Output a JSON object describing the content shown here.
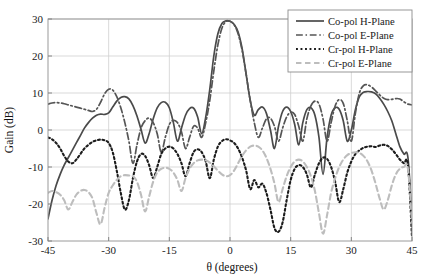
{
  "chart_data": {
    "type": "line",
    "title": "",
    "xlabel": "θ (degrees)",
    "ylabel": "Gain (dB)",
    "xlim": [
      -45,
      45
    ],
    "ylim": [
      -30,
      30
    ],
    "xticks": [
      -45,
      -30,
      -15,
      0,
      15,
      30,
      45
    ],
    "xticklabels": [
      "-45",
      "-30",
      "-15",
      "0",
      "15",
      "30",
      "45"
    ],
    "yticks": [
      -30,
      -20,
      -10,
      0,
      10,
      20,
      30
    ],
    "yticklabels": [
      "-30",
      "-20",
      "-10",
      "0",
      "10",
      "20",
      "30"
    ],
    "grid": true,
    "legend_position": "upper right",
    "series": [
      {
        "name": "Co-pol H-Plane",
        "color": "#4a4a4a",
        "style": "solid",
        "width": 1.7,
        "x": [
          -45,
          -44,
          -43,
          -42,
          -41,
          -40,
          -39,
          -38,
          -37,
          -36,
          -35,
          -34,
          -33,
          -32,
          -31,
          -30,
          -29,
          -28,
          -27,
          -26,
          -25,
          -24,
          -23,
          -22,
          -21,
          -20,
          -19,
          -18,
          -17,
          -16,
          -15,
          -14,
          -13,
          -12,
          -11,
          -10,
          -9,
          -8,
          -7,
          -6,
          -5,
          -4,
          -3,
          -2,
          -1,
          0,
          1,
          2,
          3,
          4,
          5,
          6,
          7,
          8,
          9,
          10,
          11,
          12,
          13,
          14,
          15,
          16,
          17,
          18,
          19,
          20,
          21,
          22,
          23,
          24,
          25,
          26,
          27,
          28,
          29,
          30,
          31,
          32,
          33,
          34,
          35,
          36,
          37,
          38,
          39,
          40,
          41,
          42,
          43,
          44,
          45
        ],
        "y": [
          -24.0,
          -19.0,
          -15.0,
          -12.0,
          -9.5,
          -7.5,
          -5.5,
          -3.5,
          -1.5,
          0.5,
          2.0,
          3.2,
          4.0,
          4.3,
          4.2,
          4.6,
          6.2,
          7.8,
          8.8,
          9.0,
          8.4,
          6.6,
          3.8,
          0.2,
          -3.5,
          -1.0,
          3.0,
          6.0,
          7.4,
          7.5,
          6.0,
          2.0,
          -3.0,
          0.5,
          4.0,
          5.8,
          5.9,
          3.5,
          -1.0,
          3.5,
          11.0,
          20.0,
          26.0,
          28.8,
          29.5,
          29.4,
          28.6,
          26.5,
          22.0,
          15.0,
          8.0,
          4.0,
          5.5,
          6.2,
          4.5,
          0.0,
          -5.0,
          1.0,
          5.0,
          6.2,
          5.0,
          1.5,
          -4.0,
          2.0,
          5.5,
          6.0,
          4.0,
          -2.0,
          -12.0,
          -2.0,
          4.0,
          6.0,
          5.6,
          2.5,
          -3.0,
          0.0,
          5.5,
          9.0,
          10.2,
          10.4,
          10.3,
          9.8,
          8.6,
          7.0,
          5.0,
          2.5,
          -1.0,
          -4.5,
          -6.5,
          -7.5,
          -24.0
        ]
      },
      {
        "name": "Co-pol E-Plane",
        "color": "#555555",
        "style": "dashdot",
        "width": 1.7,
        "x": [
          -45,
          -44,
          -43,
          -42,
          -41,
          -40,
          -39,
          -38,
          -37,
          -36,
          -35,
          -34,
          -33,
          -32,
          -31,
          -30,
          -29,
          -28,
          -27,
          -26,
          -25,
          -24,
          -23,
          -22,
          -21,
          -20,
          -19,
          -18,
          -17,
          -16,
          -15,
          -14,
          -13,
          -12,
          -11,
          -10,
          -9,
          -8,
          -7,
          -6,
          -5,
          -4,
          -3,
          -2,
          -1,
          0,
          1,
          2,
          3,
          4,
          5,
          6,
          7,
          8,
          9,
          10,
          11,
          12,
          13,
          14,
          15,
          16,
          17,
          18,
          19,
          20,
          21,
          22,
          23,
          24,
          25,
          26,
          27,
          28,
          29,
          30,
          31,
          32,
          33,
          34,
          35,
          36,
          37,
          38,
          39,
          40,
          41,
          42,
          43,
          44,
          45
        ],
        "y": [
          7.0,
          7.3,
          7.4,
          7.3,
          7.1,
          6.8,
          6.5,
          6.2,
          5.9,
          5.6,
          5.3,
          5.0,
          5.6,
          7.5,
          9.8,
          11.0,
          10.8,
          9.0,
          6.0,
          2.0,
          -3.0,
          -9.0,
          -4.0,
          0.5,
          2.5,
          3.2,
          2.0,
          -1.0,
          -6.0,
          -2.0,
          1.5,
          2.6,
          2.0,
          -0.5,
          -5.0,
          -2.0,
          1.0,
          0.5,
          -2.0,
          2.0,
          8.0,
          16.0,
          23.0,
          27.5,
          29.3,
          29.4,
          28.5,
          26.0,
          21.5,
          15.0,
          8.0,
          2.0,
          -2.0,
          0.5,
          3.0,
          3.2,
          1.0,
          -3.0,
          0.5,
          3.5,
          4.8,
          4.2,
          1.0,
          -3.0,
          3.0,
          6.5,
          7.8,
          7.0,
          3.0,
          -3.0,
          2.0,
          6.5,
          8.2,
          7.2,
          2.5,
          -3.0,
          4.5,
          10.0,
          12.0,
          12.2,
          11.6,
          10.6,
          9.5,
          8.6,
          8.2,
          8.3,
          8.5,
          8.4,
          7.6,
          7.0,
          6.8
        ]
      },
      {
        "name": "Cr-pol H-Plane",
        "color": "#1c1c1c",
        "style": "dotted",
        "width": 2.1,
        "x": [
          -45,
          -44,
          -43,
          -42,
          -41,
          -40,
          -39,
          -38,
          -37,
          -36,
          -35,
          -34,
          -33,
          -32,
          -31,
          -30,
          -29,
          -28,
          -27,
          -26,
          -25,
          -24,
          -23,
          -22,
          -21,
          -20,
          -19,
          -18,
          -17,
          -16,
          -15,
          -14,
          -13,
          -12,
          -11,
          -10,
          -9,
          -8,
          -7,
          -6,
          -5,
          -4,
          -3,
          -2,
          -1,
          0,
          1,
          2,
          3,
          4,
          5,
          6,
          7,
          8,
          9,
          10,
          11,
          12,
          13,
          14,
          15,
          16,
          17,
          18,
          19,
          20,
          21,
          22,
          23,
          24,
          25,
          26,
          27,
          28,
          29,
          30,
          31,
          32,
          33,
          34,
          35,
          36,
          37,
          38,
          39,
          40,
          41,
          42,
          43,
          44,
          45
        ],
        "y": [
          -2.0,
          -2.5,
          -3.5,
          -5.0,
          -7.0,
          -8.5,
          -9.0,
          -8.0,
          -6.5,
          -5.0,
          -4.0,
          -3.2,
          -2.8,
          -2.6,
          -2.8,
          -3.5,
          -6.0,
          -11.0,
          -17.0,
          -21.5,
          -19.0,
          -13.0,
          -8.5,
          -6.5,
          -7.0,
          -9.5,
          -13.0,
          -10.0,
          -6.5,
          -5.0,
          -4.5,
          -5.0,
          -6.5,
          -9.0,
          -12.5,
          -9.0,
          -6.0,
          -5.2,
          -6.0,
          -8.5,
          -13.0,
          -8.0,
          -4.5,
          -3.0,
          -2.5,
          -2.8,
          -3.5,
          -5.0,
          -7.5,
          -11.0,
          -16.0,
          -13.5,
          -15.5,
          -14.5,
          -17.0,
          -21.5,
          -26.5,
          -27.5,
          -25.0,
          -19.0,
          -13.5,
          -10.5,
          -9.5,
          -10.0,
          -12.0,
          -15.5,
          -12.0,
          -9.0,
          -7.5,
          -7.8,
          -10.0,
          -14.0,
          -19.5,
          -16.0,
          -11.5,
          -8.5,
          -6.5,
          -5.5,
          -4.8,
          -4.5,
          -4.4,
          -4.6,
          -4.2,
          -4.0,
          -4.3,
          -5.2,
          -6.5,
          -8.0,
          -9.0,
          -9.5,
          -29.0
        ]
      },
      {
        "name": "Cr-pol E-Plane",
        "color": "#bdbdbd",
        "style": "dashed",
        "width": 2.1,
        "x": [
          -45,
          -44,
          -43,
          -42,
          -41,
          -40,
          -39,
          -38,
          -37,
          -36,
          -35,
          -34,
          -33,
          -32,
          -31,
          -30,
          -29,
          -28,
          -27,
          -26,
          -25,
          -24,
          -23,
          -22,
          -21,
          -20,
          -19,
          -18,
          -17,
          -16,
          -15,
          -14,
          -13,
          -12,
          -11,
          -10,
          -9,
          -8,
          -7,
          -6,
          -5,
          -4,
          -3,
          -2,
          -1,
          0,
          1,
          2,
          3,
          4,
          5,
          6,
          7,
          8,
          9,
          10,
          11,
          12,
          13,
          14,
          15,
          16,
          17,
          18,
          19,
          20,
          21,
          22,
          23,
          24,
          25,
          26,
          27,
          28,
          29,
          30,
          31,
          32,
          33,
          34,
          35,
          36,
          37,
          38,
          39,
          40,
          41,
          42,
          43,
          44,
          45
        ],
        "y": [
          -17.0,
          -16.5,
          -16.8,
          -17.5,
          -19.0,
          -21.5,
          -19.5,
          -17.5,
          -16.5,
          -16.2,
          -16.8,
          -18.5,
          -22.5,
          -25.5,
          -21.0,
          -17.0,
          -15.0,
          -13.5,
          -12.5,
          -12.2,
          -12.3,
          -12.5,
          -14.0,
          -17.5,
          -22.0,
          -18.0,
          -14.0,
          -11.5,
          -10.5,
          -10.2,
          -10.5,
          -11.5,
          -13.5,
          -16.5,
          -13.0,
          -10.5,
          -9.0,
          -8.2,
          -8.0,
          -8.2,
          -8.8,
          -9.8,
          -11.0,
          -12.0,
          -12.5,
          -12.2,
          -11.0,
          -9.0,
          -7.0,
          -5.5,
          -4.5,
          -4.2,
          -4.5,
          -5.5,
          -7.5,
          -10.5,
          -14.5,
          -19.5,
          -16.0,
          -12.5,
          -10.0,
          -8.5,
          -8.0,
          -8.5,
          -10.0,
          -12.5,
          -16.5,
          -22.5,
          -28.0,
          -23.0,
          -17.0,
          -13.0,
          -10.0,
          -8.0,
          -6.8,
          -6.2,
          -6.0,
          -6.2,
          -7.0,
          -8.5,
          -11.0,
          -14.5,
          -18.5,
          -21.5,
          -19.0,
          -15.0,
          -12.0,
          -10.5,
          -10.0,
          -10.5,
          -25.0
        ]
      }
    ]
  },
  "legend": {
    "entries": [
      {
        "label": "Co-pol H-Plane"
      },
      {
        "label": "Co-pol E-Plane"
      },
      {
        "label": "Cr-pol H-Plane"
      },
      {
        "label": "Cr-pol E-Plane"
      }
    ]
  }
}
